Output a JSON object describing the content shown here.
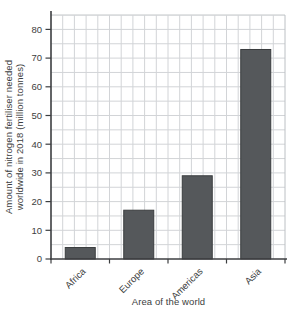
{
  "chart_data": {
    "type": "bar",
    "title": "",
    "categories": [
      "Africa",
      "Europe",
      "Americas",
      "Asia"
    ],
    "values": [
      4,
      17,
      29,
      73
    ],
    "xlabel": "Area of the world",
    "ylabel_line1": "Amount of nitrogen fertiliser needed",
    "ylabel_line2": "worldwide in 2018 (million tonnes)",
    "ylim": [
      0,
      85
    ],
    "ytick_step": 10,
    "ytick_labels": [
      "0",
      "10",
      "20",
      "30",
      "40",
      "50",
      "60",
      "70",
      "80"
    ],
    "grid": "on",
    "grid_minor_step": 5,
    "legend": "none",
    "colors": {
      "bar_fill": "#55585b",
      "bar_edge": "#3a3d3f",
      "grid_line": "#d2d4d7",
      "grid_border": "#bcc0c4",
      "axis_line": "#3c3e40",
      "text": "#3c3e40",
      "background": "#ffffff"
    }
  }
}
